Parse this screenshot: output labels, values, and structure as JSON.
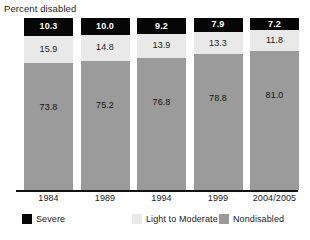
{
  "chart_data": {
    "type": "bar",
    "subtype": "stacked-100-percent",
    "title": "Percent disabled",
    "xlabel": "",
    "ylabel": "",
    "ylim": [
      0,
      100
    ],
    "grid": false,
    "legend_position": "bottom",
    "categories": [
      "1984",
      "1989",
      "1994",
      "1999",
      "2004/2005"
    ],
    "series": [
      {
        "name": "Severe",
        "color": "#060606",
        "values": [
          10.3,
          10.0,
          9.2,
          7.9,
          7.2
        ],
        "labels": [
          "10.3",
          "10.0",
          "9.2",
          "7.9",
          "7.2"
        ]
      },
      {
        "name": "Light to Moderate",
        "color": "#e9e9e9",
        "values": [
          15.9,
          14.8,
          13.9,
          13.3,
          11.8
        ],
        "labels": [
          "15.9",
          "14.8",
          "13.9",
          "13.3",
          "11.8"
        ]
      },
      {
        "name": "Nondisabled",
        "color": "#9b9b9b",
        "values": [
          73.8,
          75.2,
          76.8,
          78.8,
          81.0
        ],
        "labels": [
          "73.8",
          "75.2",
          "76.8",
          "78.8",
          "81.0"
        ]
      }
    ]
  },
  "legend": {
    "items": [
      {
        "label": "Severe",
        "color": "#060606"
      },
      {
        "label": "Light to Moderate",
        "color": "#e9e9e9"
      },
      {
        "label": "Nondisabled",
        "color": "#9b9b9b"
      }
    ]
  },
  "axis": {
    "baseline_color": "#111111"
  }
}
